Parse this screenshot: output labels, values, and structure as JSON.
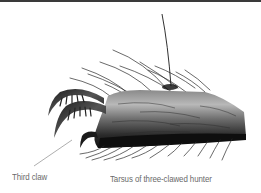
{
  "figure": {
    "labels": {
      "third_claw": "Third claw",
      "caption": "Tarsus of three-clawed hunter"
    },
    "colors": {
      "background": "#ffffff",
      "ink_dark": "#1a1a1a",
      "ink_mid": "#4a4a4a",
      "ink_light": "#9a9a9a",
      "label_text": "#6a6a6a",
      "top_bar": "#3a3a3a"
    }
  }
}
